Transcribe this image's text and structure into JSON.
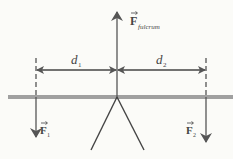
{
  "diagram": {
    "labels": {
      "force_fulcrum_main": "F",
      "force_fulcrum_sub": "fulcrum",
      "distance_1_main": "d",
      "distance_1_sub": "1",
      "distance_2_main": "d",
      "distance_2_sub": "2",
      "force_1_main": "F",
      "force_1_sub": "1",
      "force_2_main": "F",
      "force_2_sub": "2"
    },
    "colors": {
      "line": "#555555",
      "beam": "#a0a0a0",
      "background": "#fbfbf8"
    }
  }
}
